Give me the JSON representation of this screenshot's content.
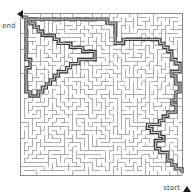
{
  "figure": {
    "kind": "maze-puzzle",
    "width": 193,
    "height": 195,
    "background_color": "#ffffff"
  },
  "labels": {
    "end": {
      "text": "end",
      "marker_icon": "triangle-left-icon",
      "position": "top-left"
    },
    "start": {
      "text": "start",
      "marker_icon": "triangle-up-icon",
      "position": "bottom-right"
    }
  },
  "maze": {
    "columns": 40,
    "rows": 40,
    "cell_size": 4.05,
    "origin_x": 20,
    "origin_y": 13,
    "wall_color": "#9a9a9a",
    "wall_width": 0.8,
    "border_color": "#8a8a8a",
    "border_width": 1.0,
    "solution_color": "#555555",
    "solution_width": 2.2,
    "solution_outline_color": "#3a3a3a"
  },
  "solution_path": [
    [
      39.5,
      39.0
    ],
    [
      39.5,
      38.0
    ],
    [
      38.0,
      38.0
    ],
    [
      38.0,
      37.0
    ],
    [
      37.0,
      37.0
    ],
    [
      37.0,
      36.0
    ],
    [
      36.0,
      36.0
    ],
    [
      36.0,
      35.0
    ],
    [
      36.0,
      34.0
    ],
    [
      35.0,
      34.0
    ],
    [
      34.0,
      34.0
    ],
    [
      34.0,
      33.0
    ],
    [
      33.0,
      33.0
    ],
    [
      33.0,
      32.0
    ],
    [
      33.0,
      31.0
    ],
    [
      34.0,
      31.0
    ],
    [
      35.0,
      31.0
    ],
    [
      35.0,
      30.0
    ],
    [
      34.0,
      30.0
    ],
    [
      34.0,
      29.0
    ],
    [
      33.0,
      29.0
    ],
    [
      32.0,
      29.0
    ],
    [
      32.0,
      28.0
    ],
    [
      31.0,
      28.0
    ],
    [
      31.0,
      27.0
    ],
    [
      32.0,
      27.0
    ],
    [
      33.0,
      27.0
    ],
    [
      34.0,
      27.0
    ],
    [
      34.0,
      26.0
    ],
    [
      35.0,
      26.0
    ],
    [
      35.0,
      25.0
    ],
    [
      36.0,
      25.0
    ],
    [
      36.0,
      24.0
    ],
    [
      37.0,
      24.0
    ],
    [
      38.0,
      24.0
    ],
    [
      38.0,
      23.0
    ],
    [
      38.0,
      22.0
    ],
    [
      37.0,
      22.0
    ],
    [
      37.0,
      21.0
    ],
    [
      38.0,
      21.0
    ],
    [
      38.0,
      20.0
    ],
    [
      38.0,
      19.0
    ],
    [
      39.0,
      19.0
    ],
    [
      39.0,
      18.0
    ],
    [
      39.0,
      17.0
    ],
    [
      38.0,
      17.0
    ],
    [
      38.0,
      16.0
    ],
    [
      38.0,
      15.0
    ],
    [
      37.0,
      15.0
    ],
    [
      37.0,
      14.0
    ],
    [
      38.0,
      14.0
    ],
    [
      39.0,
      14.0
    ],
    [
      39.0,
      13.0
    ],
    [
      39.0,
      12.0
    ],
    [
      38.0,
      12.0
    ],
    [
      38.0,
      11.0
    ],
    [
      37.0,
      11.0
    ],
    [
      37.0,
      10.0
    ],
    [
      37.0,
      9.0
    ],
    [
      36.0,
      9.0
    ],
    [
      36.0,
      8.0
    ],
    [
      35.0,
      8.0
    ],
    [
      35.0,
      7.0
    ],
    [
      34.0,
      7.0
    ],
    [
      34.0,
      6.0
    ],
    [
      33.0,
      6.0
    ],
    [
      32.0,
      6.0
    ],
    [
      31.0,
      6.0
    ],
    [
      30.0,
      6.0
    ],
    [
      29.0,
      6.0
    ],
    [
      28.0,
      6.0
    ],
    [
      27.0,
      6.0
    ],
    [
      26.0,
      6.0
    ],
    [
      25.0,
      6.0
    ],
    [
      25.0,
      7.0
    ],
    [
      24.0,
      7.0
    ],
    [
      23.0,
      7.0
    ],
    [
      23.0,
      6.0
    ],
    [
      23.0,
      5.0
    ],
    [
      23.0,
      4.0
    ],
    [
      23.0,
      3.0
    ],
    [
      23.0,
      2.0
    ],
    [
      22.0,
      2.0
    ],
    [
      21.0,
      2.0
    ],
    [
      21.0,
      1.0
    ],
    [
      20.0,
      1.0
    ],
    [
      19.0,
      1.0
    ],
    [
      18.0,
      1.0
    ],
    [
      17.0,
      1.0
    ],
    [
      16.0,
      1.0
    ],
    [
      15.0,
      1.0
    ],
    [
      14.0,
      1.0
    ],
    [
      13.0,
      1.0
    ],
    [
      12.0,
      1.0
    ],
    [
      11.0,
      1.0
    ],
    [
      10.0,
      1.0
    ],
    [
      9.0,
      1.0
    ],
    [
      8.0,
      1.0
    ],
    [
      7.0,
      1.0
    ],
    [
      6.0,
      1.0
    ],
    [
      5.0,
      1.0
    ],
    [
      4.0,
      1.0
    ],
    [
      3.0,
      1.0
    ],
    [
      2.0,
      1.0
    ],
    [
      2.0,
      2.0
    ],
    [
      3.0,
      2.0
    ],
    [
      3.0,
      3.0
    ],
    [
      4.0,
      3.0
    ],
    [
      4.0,
      4.0
    ],
    [
      5.0,
      4.0
    ],
    [
      5.0,
      5.0
    ],
    [
      6.0,
      5.0
    ],
    [
      7.0,
      5.0
    ],
    [
      8.0,
      5.0
    ],
    [
      8.0,
      6.0
    ],
    [
      9.0,
      6.0
    ],
    [
      9.0,
      7.0
    ],
    [
      10.0,
      7.0
    ],
    [
      11.0,
      7.0
    ],
    [
      12.0,
      7.0
    ],
    [
      12.0,
      8.0
    ],
    [
      13.0,
      8.0
    ],
    [
      14.0,
      8.0
    ],
    [
      15.0,
      8.0
    ],
    [
      15.0,
      9.0
    ],
    [
      16.0,
      9.0
    ],
    [
      17.0,
      9.0
    ],
    [
      18.0,
      9.0
    ],
    [
      18.0,
      10.0
    ],
    [
      18.0,
      11.0
    ],
    [
      17.0,
      11.0
    ],
    [
      16.0,
      11.0
    ],
    [
      15.0,
      11.0
    ],
    [
      14.0,
      11.0
    ],
    [
      14.0,
      12.0
    ],
    [
      13.0,
      12.0
    ],
    [
      12.0,
      12.0
    ],
    [
      12.0,
      13.0
    ],
    [
      11.0,
      13.0
    ],
    [
      11.0,
      14.0
    ],
    [
      10.0,
      14.0
    ],
    [
      9.0,
      14.0
    ],
    [
      9.0,
      15.0
    ],
    [
      8.0,
      15.0
    ],
    [
      8.0,
      16.0
    ],
    [
      7.0,
      16.0
    ],
    [
      7.0,
      17.0
    ],
    [
      6.0,
      17.0
    ],
    [
      6.0,
      18.0
    ],
    [
      5.0,
      18.0
    ],
    [
      5.0,
      19.0
    ],
    [
      4.0,
      19.0
    ],
    [
      4.0,
      20.0
    ],
    [
      3.0,
      20.0
    ],
    [
      2.0,
      20.0
    ],
    [
      2.0,
      19.0
    ],
    [
      1.0,
      19.0
    ],
    [
      1.0,
      18.0
    ],
    [
      1.0,
      17.0
    ],
    [
      1.0,
      16.0
    ],
    [
      1.0,
      15.0
    ],
    [
      1.0,
      14.0
    ],
    [
      1.0,
      13.0
    ],
    [
      2.0,
      13.0
    ],
    [
      2.0,
      12.0
    ],
    [
      2.0,
      11.0
    ],
    [
      1.0,
      11.0
    ],
    [
      1.0,
      10.0
    ],
    [
      1.0,
      9.0
    ],
    [
      1.0,
      8.0
    ],
    [
      1.0,
      7.0
    ],
    [
      1.0,
      6.0
    ],
    [
      1.0,
      5.0
    ],
    [
      1.0,
      4.0
    ],
    [
      1.0,
      3.0
    ],
    [
      1.0,
      2.0
    ],
    [
      1.0,
      1.0
    ],
    [
      1.0,
      0.5
    ],
    [
      0.0,
      0.5
    ]
  ]
}
